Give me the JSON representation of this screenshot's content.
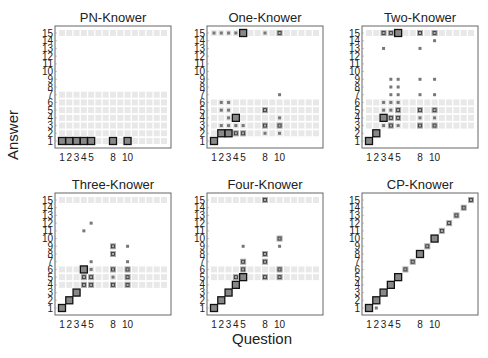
{
  "chart_data": {
    "type": "heatmap",
    "ylabel": "Answer",
    "xlabel": "Question",
    "x_ticks": [
      1,
      2,
      3,
      4,
      5,
      8,
      10
    ],
    "y_ticks": [
      1,
      2,
      3,
      4,
      5,
      6,
      7,
      8,
      9,
      10,
      11,
      12,
      13,
      14,
      15
    ],
    "xlim": [
      1,
      15
    ],
    "ylim": [
      1,
      15
    ],
    "cell_encoding": "square size/darkness = probability; black-outlined squares = observed responses",
    "panels": [
      {
        "title": "PN-Knower",
        "strong": [
          [
            1,
            1
          ],
          [
            2,
            1
          ],
          [
            3,
            1
          ],
          [
            4,
            1
          ],
          [
            5,
            1
          ],
          [
            8,
            1
          ],
          [
            10,
            1
          ]
        ],
        "medium": [],
        "small": [],
        "faint_rows": [
          1,
          2,
          3,
          4,
          5,
          6,
          7,
          15
        ]
      },
      {
        "title": "One-Knower",
        "strong": [
          [
            1,
            1
          ],
          [
            5,
            15
          ],
          [
            4,
            4
          ],
          [
            2,
            2
          ],
          [
            3,
            2
          ]
        ],
        "medium": [
          [
            8,
            5
          ],
          [
            8,
            3
          ],
          [
            10,
            3
          ],
          [
            10,
            15
          ],
          [
            4,
            2
          ],
          [
            5,
            2
          ]
        ],
        "small": [
          [
            1,
            15
          ],
          [
            2,
            15
          ],
          [
            3,
            15
          ],
          [
            4,
            15
          ],
          [
            8,
            15
          ],
          [
            2,
            6
          ],
          [
            3,
            6
          ],
          [
            2,
            5
          ],
          [
            3,
            5
          ],
          [
            3,
            4
          ],
          [
            10,
            4
          ],
          [
            2,
            3
          ],
          [
            3,
            3
          ],
          [
            4,
            3
          ],
          [
            5,
            3
          ],
          [
            8,
            2
          ],
          [
            10,
            2
          ],
          [
            10,
            7
          ]
        ],
        "faint_rows": [
          2,
          3,
          4,
          5,
          6,
          15
        ]
      },
      {
        "title": "Two-Knower",
        "strong": [
          [
            1,
            1
          ],
          [
            2,
            2
          ],
          [
            5,
            15
          ],
          [
            3,
            4
          ]
        ],
        "medium": [
          [
            3,
            15
          ],
          [
            4,
            15
          ],
          [
            8,
            15
          ],
          [
            10,
            15
          ],
          [
            4,
            4
          ],
          [
            5,
            4
          ],
          [
            5,
            5
          ],
          [
            8,
            5
          ],
          [
            10,
            5
          ],
          [
            8,
            3
          ],
          [
            10,
            3
          ],
          [
            4,
            3
          ]
        ],
        "small": [
          [
            10,
            14
          ],
          [
            3,
            13
          ],
          [
            8,
            13
          ],
          [
            4,
            9
          ],
          [
            5,
            9
          ],
          [
            8,
            9
          ],
          [
            10,
            9
          ],
          [
            4,
            8
          ],
          [
            5,
            8
          ],
          [
            4,
            7
          ],
          [
            5,
            7
          ],
          [
            8,
            7
          ],
          [
            10,
            7
          ],
          [
            3,
            6
          ],
          [
            4,
            6
          ],
          [
            5,
            6
          ],
          [
            3,
            5
          ],
          [
            4,
            5
          ],
          [
            8,
            4
          ],
          [
            10,
            4
          ],
          [
            3,
            3
          ],
          [
            5,
            3
          ]
        ],
        "faint_rows": [
          3,
          4,
          5,
          6,
          15
        ]
      },
      {
        "title": "Three-Knower",
        "strong": [
          [
            1,
            1
          ],
          [
            2,
            2
          ],
          [
            3,
            3
          ],
          [
            4,
            6
          ]
        ],
        "medium": [
          [
            4,
            5
          ],
          [
            5,
            5
          ],
          [
            10,
            5
          ],
          [
            4,
            4
          ],
          [
            5,
            4
          ],
          [
            8,
            4
          ],
          [
            10,
            4
          ],
          [
            8,
            9
          ],
          [
            8,
            8
          ],
          [
            8,
            6
          ],
          [
            10,
            6
          ]
        ],
        "small": [
          [
            4,
            11
          ],
          [
            5,
            12
          ],
          [
            10,
            9
          ],
          [
            5,
            7
          ],
          [
            10,
            7
          ],
          [
            5,
            6
          ],
          [
            8,
            5
          ]
        ],
        "faint_rows": [
          4,
          5,
          6,
          15
        ]
      },
      {
        "title": "Four-Knower",
        "strong": [
          [
            1,
            1
          ],
          [
            2,
            2
          ],
          [
            3,
            3
          ],
          [
            4,
            4
          ],
          [
            5,
            5
          ]
        ],
        "medium": [
          [
            4,
            5
          ],
          [
            8,
            5
          ],
          [
            10,
            5
          ],
          [
            8,
            15
          ],
          [
            10,
            10
          ],
          [
            8,
            8
          ],
          [
            8,
            7
          ],
          [
            5,
            7
          ],
          [
            5,
            6
          ],
          [
            10,
            6
          ]
        ],
        "small": [
          [
            5,
            9
          ],
          [
            10,
            9
          ]
        ],
        "faint_rows": [
          5,
          6,
          15
        ]
      },
      {
        "title": "CP-Knower",
        "strong": [
          [
            1,
            1
          ],
          [
            2,
            2
          ],
          [
            3,
            3
          ],
          [
            4,
            4
          ],
          [
            5,
            5
          ],
          [
            8,
            8
          ],
          [
            10,
            10
          ]
        ],
        "medium": [
          [
            6,
            6
          ],
          [
            7,
            7
          ],
          [
            9,
            9
          ],
          [
            11,
            11
          ],
          [
            12,
            12
          ],
          [
            13,
            13
          ],
          [
            14,
            14
          ],
          [
            15,
            15
          ]
        ],
        "small": [
          [
            2,
            1
          ]
        ],
        "faint_rows": []
      }
    ]
  }
}
